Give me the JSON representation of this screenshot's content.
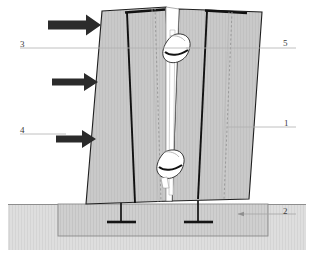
{
  "diagram": {
    "labels": [
      {
        "id": "label-1",
        "text": "1",
        "refers_to": "wall-panel",
        "x": 284,
        "y": 119
      },
      {
        "id": "label-2",
        "text": "2",
        "refers_to": "foundation-block",
        "x": 283,
        "y": 207
      },
      {
        "id": "label-3",
        "text": "3",
        "refers_to": "upper-panel-joint",
        "x": 20,
        "y": 40
      },
      {
        "id": "label-4",
        "text": "4",
        "refers_to": "lateral-load-arrow",
        "x": 20,
        "y": 126
      },
      {
        "id": "label-5",
        "text": "5",
        "refers_to": "joint-connector",
        "x": 283,
        "y": 39
      }
    ],
    "load_arrows": [
      {
        "name": "load-arrow-top",
        "y": 25,
        "x_start": 48,
        "x_end": 101
      },
      {
        "name": "load-arrow-middle",
        "y": 82,
        "x_start": 52,
        "x_end": 98
      },
      {
        "name": "load-arrow-bottom",
        "y": 139,
        "x_start": 56,
        "x_end": 96
      }
    ],
    "panels": [
      {
        "name": "wall-panel-left",
        "fill": "#c9c9c9",
        "stroke": "#1a1a1a"
      },
      {
        "name": "wall-panel-right",
        "fill": "#c9c9c9",
        "stroke": "#1a1a1a"
      }
    ],
    "connectors": [
      {
        "name": "joint-connector-upper",
        "fill": "#ffffff"
      },
      {
        "name": "joint-connector-lower",
        "fill": "#ffffff"
      }
    ],
    "anchors": [
      {
        "name": "t-anchor-left",
        "stem_x": 121,
        "bar_y": 222
      },
      {
        "name": "t-anchor-right",
        "stem_x": 198,
        "bar_y": 222
      }
    ],
    "ground": {
      "name": "ground-soil",
      "fill": "#dedede",
      "top_y": 204
    },
    "foundation": {
      "name": "foundation-block",
      "fill": "#cfcfcf",
      "x": 58,
      "y": 204,
      "width": 210,
      "height": 32
    },
    "colors": {
      "panel_fill": "#c9c9c9",
      "panel_stroke": "#1a1a1a",
      "rebar": "#111111",
      "ground_fill": "#dedede",
      "foundation_fill": "#cfcfcf",
      "arrow_fill": "#2b2b2b",
      "leader_line": "#aaaaaa",
      "label_text": "#3b3b3b"
    }
  }
}
